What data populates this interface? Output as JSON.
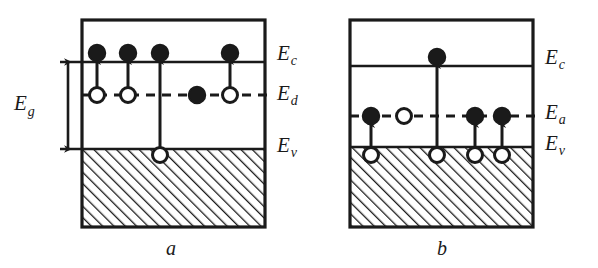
{
  "figure": {
    "background_color": "#ffffff",
    "ink_color": "#1a1a1a",
    "width": 598,
    "height": 268
  },
  "panels": [
    {
      "id": "a",
      "caption": "a",
      "caption_x": 166,
      "caption_y": 255,
      "box": {
        "x": 82,
        "y": 20,
        "w": 183,
        "h": 207
      },
      "levels": [
        {
          "name": "Ec",
          "symbol": "E",
          "subscript": "c",
          "y": 62,
          "style": "solid",
          "label_x": 277,
          "label_y": 60,
          "x1": 60,
          "x2": 265
        },
        {
          "name": "Ed",
          "symbol": "E",
          "subscript": "d",
          "y": 95,
          "style": "dashed",
          "label_x": 277,
          "label_y": 100,
          "x1": 82,
          "x2": 273
        },
        {
          "name": "Ev",
          "symbol": "E",
          "subscript": "v",
          "y": 149,
          "style": "solid",
          "label_x": 277,
          "label_y": 152,
          "x1": 60,
          "x2": 265
        }
      ],
      "gap_arrow": {
        "label": "Eg",
        "symbol": "E",
        "subscript": "g",
        "x": 68,
        "y_top": 62,
        "y_bottom": 149,
        "label_x": 14,
        "label_y": 110,
        "double_headed": true
      },
      "valence_fill": {
        "x": 82,
        "y": 149,
        "w": 183,
        "h": 78,
        "pattern": "diagonal-hatch"
      },
      "particles": [
        {
          "type": "electron",
          "fill": "solid",
          "x": 97,
          "y": 53
        },
        {
          "type": "electron",
          "fill": "solid",
          "x": 128,
          "y": 53
        },
        {
          "type": "electron",
          "fill": "solid",
          "x": 160,
          "y": 53
        },
        {
          "type": "electron",
          "fill": "solid",
          "x": 230,
          "y": 53
        },
        {
          "type": "donor-empty",
          "fill": "open",
          "x": 97,
          "y": 95
        },
        {
          "type": "donor-empty",
          "fill": "open",
          "x": 128,
          "y": 95
        },
        {
          "type": "donor-filled",
          "fill": "solid",
          "x": 197,
          "y": 95
        },
        {
          "type": "donor-empty",
          "fill": "open",
          "x": 230,
          "y": 95
        },
        {
          "type": "hole",
          "fill": "open",
          "x": 160,
          "y": 155
        }
      ],
      "transitions": [
        {
          "from": "Ed",
          "to": "Ec",
          "x": 97,
          "y_start": 88,
          "y_end": 61
        },
        {
          "from": "Ed",
          "to": "Ec",
          "x": 128,
          "y_start": 88,
          "y_end": 61
        },
        {
          "from": "Ev",
          "to": "Ec",
          "x": 160,
          "y_start": 149,
          "y_end": 61
        },
        {
          "from": "Ed",
          "to": "Ec",
          "x": 230,
          "y_start": 88,
          "y_end": 61
        }
      ]
    },
    {
      "id": "b",
      "caption": "b",
      "caption_x": 437,
      "caption_y": 255,
      "box": {
        "x": 350,
        "y": 20,
        "w": 183,
        "h": 207
      },
      "levels": [
        {
          "name": "Ec",
          "symbol": "E",
          "subscript": "c",
          "y": 66,
          "style": "solid",
          "label_x": 545,
          "label_y": 64,
          "x1": 350,
          "x2": 533
        },
        {
          "name": "Ea",
          "symbol": "E",
          "subscript": "a",
          "y": 116,
          "style": "dashed",
          "label_x": 545,
          "label_y": 119,
          "x1": 350,
          "x2": 541
        },
        {
          "name": "Ev",
          "symbol": "E",
          "subscript": "v",
          "y": 147,
          "style": "solid",
          "label_x": 545,
          "label_y": 150,
          "x1": 350,
          "x2": 533
        }
      ],
      "valence_fill": {
        "x": 350,
        "y": 147,
        "w": 183,
        "h": 80,
        "pattern": "diagonal-hatch"
      },
      "particles": [
        {
          "type": "electron",
          "fill": "solid",
          "x": 437,
          "y": 57
        },
        {
          "type": "acceptor-filled",
          "fill": "solid",
          "x": 371,
          "y": 116
        },
        {
          "type": "acceptor-empty",
          "fill": "open",
          "x": 404,
          "y": 116
        },
        {
          "type": "acceptor-filled",
          "fill": "solid",
          "x": 475,
          "y": 116
        },
        {
          "type": "acceptor-filled",
          "fill": "solid",
          "x": 502,
          "y": 116
        },
        {
          "type": "hole",
          "fill": "open",
          "x": 371,
          "y": 155
        },
        {
          "type": "hole",
          "fill": "open",
          "x": 437,
          "y": 155
        },
        {
          "type": "hole",
          "fill": "open",
          "x": 475,
          "y": 155
        },
        {
          "type": "hole",
          "fill": "open",
          "x": 502,
          "y": 155
        }
      ],
      "transitions": [
        {
          "from": "Ev",
          "to": "Ea",
          "x": 371,
          "y_start": 148,
          "y_end": 124
        },
        {
          "from": "Ev",
          "to": "Ec",
          "x": 437,
          "y_start": 148,
          "y_end": 65
        },
        {
          "from": "Ev",
          "to": "Ea",
          "x": 475,
          "y_start": 148,
          "y_end": 124
        },
        {
          "from": "Ev",
          "to": "Ea",
          "x": 502,
          "y_start": 148,
          "y_end": 124
        }
      ]
    }
  ]
}
